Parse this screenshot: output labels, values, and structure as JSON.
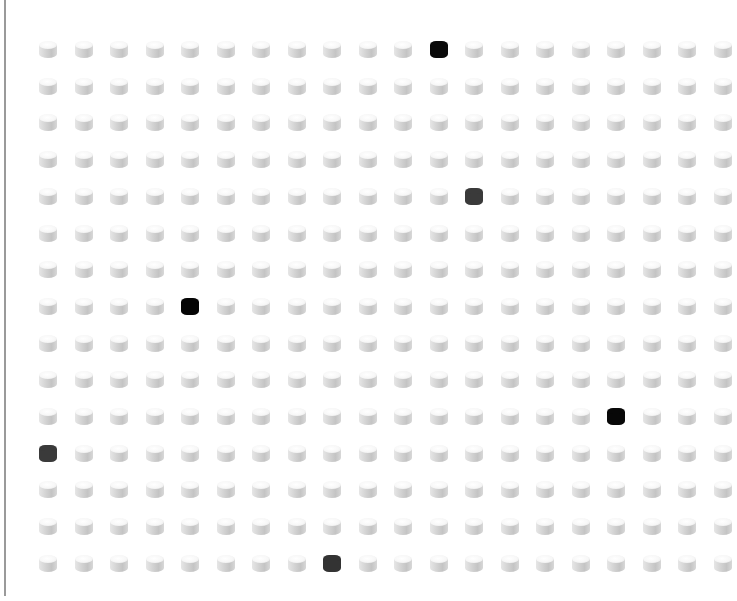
{
  "grid": {
    "rows": 15,
    "cols": 20,
    "origin_x": 48,
    "origin_y": 49,
    "step_x": 35.5,
    "step_y": 36.7,
    "default_color": "#e0e0e0",
    "highlighted": [
      {
        "row": 1,
        "col": 12,
        "color": "#0a0a0a"
      },
      {
        "row": 5,
        "col": 13,
        "color": "#3a3a3a"
      },
      {
        "row": 8,
        "col": 5,
        "color": "#050505"
      },
      {
        "row": 11,
        "col": 17,
        "color": "#080808"
      },
      {
        "row": 12,
        "col": 1,
        "color": "#3a3a3a"
      },
      {
        "row": 15,
        "col": 9,
        "color": "#333333"
      }
    ]
  },
  "left_rule": {
    "color": "#9a9a9a"
  }
}
